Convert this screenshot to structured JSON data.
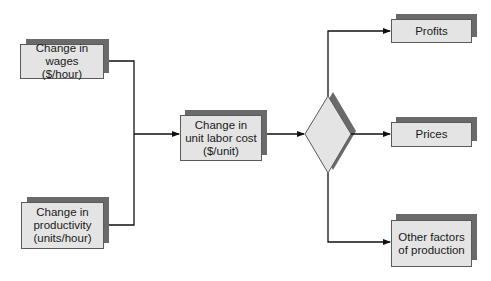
{
  "diagram": {
    "type": "flowchart",
    "nodes": {
      "wages": {
        "label": "Change in wages\n($/hour)"
      },
      "productivity": {
        "label": "Change in\nproductivity\n(units/hour)"
      },
      "unit_labor_cost": {
        "label": "Change in\nunit labor cost\n($/unit)"
      },
      "decision": {
        "label": "",
        "shape": "diamond"
      },
      "profits": {
        "label": "Profits"
      },
      "prices": {
        "label": "Prices"
      },
      "other_factors": {
        "label": "Other factors\nof production"
      }
    },
    "edges": [
      {
        "from": "wages",
        "to": "unit_labor_cost"
      },
      {
        "from": "productivity",
        "to": "unit_labor_cost"
      },
      {
        "from": "unit_labor_cost",
        "to": "decision"
      },
      {
        "from": "decision",
        "to": "profits"
      },
      {
        "from": "decision",
        "to": "prices"
      },
      {
        "from": "decision",
        "to": "other_factors"
      }
    ],
    "colors": {
      "box_fill": "#e4e4e4",
      "box_border": "#5a5a5a",
      "shadow": "#6a6a6a",
      "line": "#111111"
    }
  }
}
